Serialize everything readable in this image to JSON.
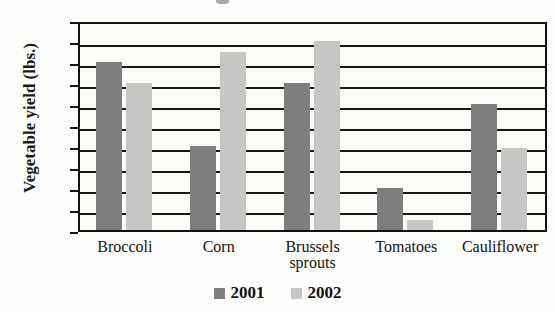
{
  "chart_data": {
    "type": "bar",
    "title": "",
    "xlabel": "",
    "ylabel": "Vegetable yield (lbs.)",
    "categories": [
      "Broccoli",
      "Corn",
      "Brussels\nsprouts",
      "Tomatoes",
      "Cauliflower"
    ],
    "series": [
      {
        "name": "2001",
        "color": "#7e7e7e",
        "values": [
          40,
          20,
          35,
          10,
          30
        ]
      },
      {
        "name": "2002",
        "color": "#c6c6c4",
        "values": [
          35,
          42.5,
          45,
          2.5,
          19.5
        ]
      }
    ],
    "ylim": [
      0,
      50
    ],
    "ytick_step": 5,
    "yticks": [
      50,
      45,
      40,
      35,
      30,
      25,
      20,
      15,
      10,
      5,
      0
    ],
    "ytick_labels": [
      "50",
      "45",
      "40",
      "35",
      "30",
      "25",
      "20",
      "15",
      "10",
      "5",
      "0"
    ],
    "grid": true,
    "legend_position": "bottom",
    "legend": [
      "2001",
      "2002"
    ]
  },
  "axis": {
    "y_title": "Vegetable yield (lbs.)"
  },
  "legend": {
    "items": [
      {
        "label": "2001",
        "color": "#7e7e7e"
      },
      {
        "label": "2002",
        "color": "#c6c6c4"
      }
    ]
  }
}
